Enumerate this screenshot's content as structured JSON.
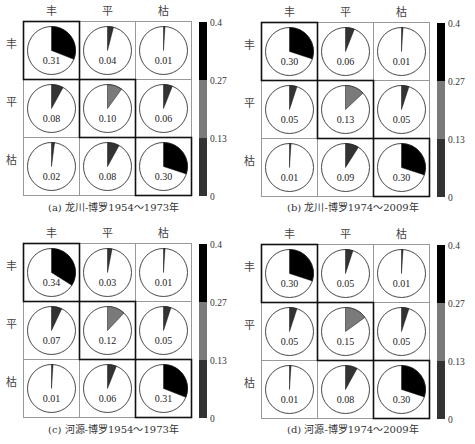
{
  "chart_data": [
    {
      "type": "heatmap",
      "title": "(a) 龙川-博罗1954～1973年",
      "row_labels": [
        "丰",
        "平",
        "枯"
      ],
      "col_labels": [
        "丰",
        "平",
        "枯"
      ],
      "values": [
        [
          0.31,
          0.04,
          0.01
        ],
        [
          0.08,
          0.1,
          0.06
        ],
        [
          0.02,
          0.08,
          0.3
        ]
      ],
      "colorbar": {
        "ticks": [
          "0.4",
          "0.27",
          "0.13",
          "0"
        ],
        "range": [
          0,
          0.4
        ]
      }
    },
    {
      "type": "heatmap",
      "title": "(b) 龙川-博罗1974～2009年",
      "row_labels": [
        "丰",
        "平",
        "枯"
      ],
      "col_labels": [
        "丰",
        "平",
        "枯"
      ],
      "values": [
        [
          0.3,
          0.06,
          0.01
        ],
        [
          0.05,
          0.13,
          0.05
        ],
        [
          0.01,
          0.09,
          0.3
        ]
      ],
      "colorbar": {
        "ticks": [
          "0.4",
          "0.27",
          "0.13",
          "0"
        ],
        "range": [
          0,
          0.4
        ]
      }
    },
    {
      "type": "heatmap",
      "title": "(c) 河源-博罗1954～1973年",
      "row_labels": [
        "丰",
        "平",
        "枯"
      ],
      "col_labels": [
        "丰",
        "平",
        "枯"
      ],
      "values": [
        [
          0.34,
          0.03,
          0.01
        ],
        [
          0.07,
          0.12,
          0.05
        ],
        [
          0.01,
          0.06,
          0.31
        ]
      ],
      "colorbar": {
        "ticks": [
          "0.4",
          "0.27",
          "0.13",
          "0"
        ],
        "range": [
          0,
          0.4
        ]
      }
    },
    {
      "type": "heatmap",
      "title": "(d) 河源-博罗1974～2009年",
      "row_labels": [
        "丰",
        "平",
        "枯"
      ],
      "col_labels": [
        "丰",
        "平",
        "枯"
      ],
      "values": [
        [
          0.3,
          0.05,
          0.01
        ],
        [
          0.05,
          0.15,
          0.05
        ],
        [
          0.01,
          0.08,
          0.3
        ]
      ],
      "colorbar": {
        "ticks": [
          "0.4",
          "0.27",
          "0.13",
          "0"
        ],
        "range": [
          0,
          0.4
        ]
      }
    }
  ],
  "colors": {
    "high": "#000000",
    "mid": "#7a7a7a",
    "low": "#333333",
    "cell_border": "#999999",
    "diag_border": "#111111"
  },
  "panels": [
    {
      "caption": "(a) 龙川-博罗1954～1973年"
    },
    {
      "caption": "(b) 龙川-博罗1974～2009年"
    },
    {
      "caption": "(c) 河源-博罗1954～1973年"
    },
    {
      "caption": "(d) 河源-博罗1974～2009年"
    }
  ]
}
